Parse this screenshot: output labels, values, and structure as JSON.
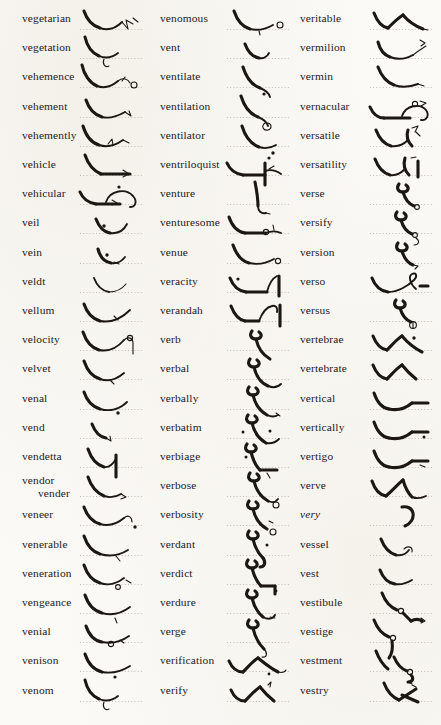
{
  "page": {
    "type": "shorthand-dictionary-page",
    "background_color": "#fbfaf7",
    "ink_color": "#1b1713",
    "baseline_color": "#b9b4a8",
    "columns": 3,
    "rows_per_column": 21,
    "total_entries": 63,
    "section": "ve-"
  },
  "columns": [
    {
      "name": "column-1",
      "entries": [
        {
          "word": "vegetarian",
          "style": "roman"
        },
        {
          "word": "vegetation",
          "style": "roman"
        },
        {
          "word": "vehemence",
          "style": "roman"
        },
        {
          "word": "vehement",
          "style": "roman"
        },
        {
          "word": "vehemently",
          "style": "roman"
        },
        {
          "word": "vehicle",
          "style": "roman"
        },
        {
          "word": "vehicular",
          "style": "roman"
        },
        {
          "word": "veil",
          "style": "roman"
        },
        {
          "word": "vein",
          "style": "roman"
        },
        {
          "word": "veldt",
          "style": "roman"
        },
        {
          "word": "vellum",
          "style": "roman"
        },
        {
          "word": "velocity",
          "style": "roman"
        },
        {
          "word": "velvet",
          "style": "roman"
        },
        {
          "word": "venal",
          "style": "roman"
        },
        {
          "word": "vend",
          "style": "roman"
        },
        {
          "word": "vendetta",
          "style": "roman"
        },
        {
          "word": "vendor",
          "alt": "vender",
          "style": "roman"
        },
        {
          "word": "veneer",
          "style": "roman"
        },
        {
          "word": "venerable",
          "style": "roman"
        },
        {
          "word": "veneration",
          "style": "roman"
        },
        {
          "word": "vengeance",
          "style": "roman"
        },
        {
          "word": "venial",
          "style": "roman"
        },
        {
          "word": "venison",
          "style": "roman"
        },
        {
          "word": "venom",
          "style": "roman"
        }
      ]
    },
    {
      "name": "column-2",
      "entries": [
        {
          "word": "venomous",
          "style": "roman"
        },
        {
          "word": "vent",
          "style": "roman"
        },
        {
          "word": "ventilate",
          "style": "roman"
        },
        {
          "word": "ventilation",
          "style": "roman"
        },
        {
          "word": "ventilator",
          "style": "roman"
        },
        {
          "word": "ventriloquist",
          "style": "roman"
        },
        {
          "word": "venture",
          "style": "roman"
        },
        {
          "word": "venturesome",
          "style": "roman"
        },
        {
          "word": "venue",
          "style": "roman"
        },
        {
          "word": "veracity",
          "style": "roman"
        },
        {
          "word": "verandah",
          "style": "roman"
        },
        {
          "word": "verb",
          "style": "roman"
        },
        {
          "word": "verbal",
          "style": "roman"
        },
        {
          "word": "verbally",
          "style": "roman"
        },
        {
          "word": "verbatim",
          "style": "roman"
        },
        {
          "word": "verbiage",
          "style": "roman"
        },
        {
          "word": "verbose",
          "style": "roman"
        },
        {
          "word": "verbosity",
          "style": "roman"
        },
        {
          "word": "verdant",
          "style": "roman"
        },
        {
          "word": "verdict",
          "style": "roman"
        },
        {
          "word": "verdure",
          "style": "roman"
        },
        {
          "word": "verge",
          "style": "roman"
        },
        {
          "word": "verification",
          "style": "roman"
        },
        {
          "word": "verify",
          "style": "roman"
        }
      ]
    },
    {
      "name": "column-3",
      "entries": [
        {
          "word": "veritable",
          "style": "roman"
        },
        {
          "word": "vermilion",
          "style": "roman"
        },
        {
          "word": "vermin",
          "style": "roman"
        },
        {
          "word": "vernacular",
          "style": "roman"
        },
        {
          "word": "versatile",
          "style": "roman"
        },
        {
          "word": "versatility",
          "style": "roman"
        },
        {
          "word": "verse",
          "style": "roman"
        },
        {
          "word": "versify",
          "style": "roman"
        },
        {
          "word": "version",
          "style": "roman"
        },
        {
          "word": "verso",
          "style": "roman"
        },
        {
          "word": "versus",
          "style": "roman"
        },
        {
          "word": "vertebrae",
          "style": "roman"
        },
        {
          "word": "vertebrate",
          "style": "roman"
        },
        {
          "word": "vertical",
          "style": "roman"
        },
        {
          "word": "vertically",
          "style": "roman"
        },
        {
          "word": "vertigo",
          "style": "roman"
        },
        {
          "word": "verve",
          "style": "roman"
        },
        {
          "word": "very",
          "style": "italic"
        },
        {
          "word": "vessel",
          "style": "roman"
        },
        {
          "word": "vest",
          "style": "roman"
        },
        {
          "word": "vestibule",
          "style": "roman"
        },
        {
          "word": "vestige",
          "style": "roman"
        },
        {
          "word": "vestment",
          "style": "roman"
        },
        {
          "word": "vestry",
          "style": "roman"
        }
      ]
    }
  ]
}
